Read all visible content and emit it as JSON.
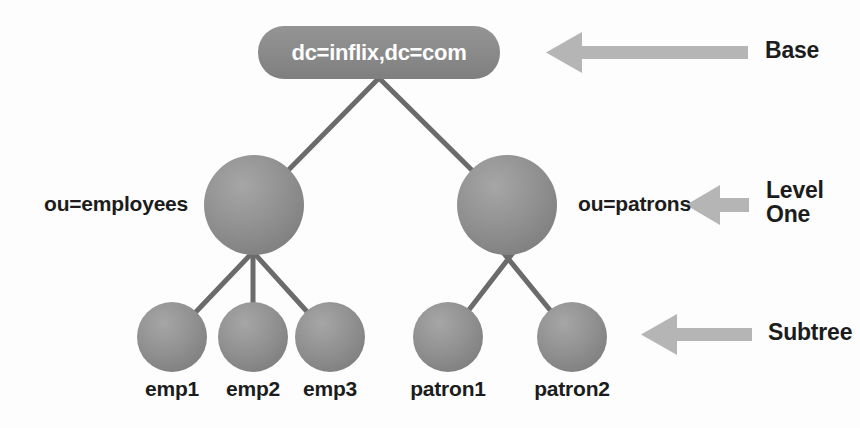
{
  "diagram": {
    "colors": {
      "node_fill": "#8d8d8d",
      "node_fill_light": "#a8a8a8",
      "node_fill_dark": "#7a7a7a",
      "edge": "#6b6b6b",
      "arrow": "#b5b5b5",
      "text": "#1c1c1c",
      "root_text": "#ffffff",
      "background": "#fdfdfd"
    },
    "root": {
      "label": "dc=inflix,dc=com",
      "shape": "rounded-rectangle"
    },
    "level_one": [
      {
        "id": "employees",
        "label": "ou=employees",
        "label_side": "left"
      },
      {
        "id": "patrons",
        "label": "ou=patrons",
        "label_side": "right"
      }
    ],
    "leaves": [
      {
        "id": "emp1",
        "label": "emp1",
        "parent": "employees"
      },
      {
        "id": "emp2",
        "label": "emp2",
        "parent": "employees"
      },
      {
        "id": "emp3",
        "label": "emp3",
        "parent": "employees"
      },
      {
        "id": "patron1",
        "label": "patron1",
        "parent": "patrons"
      },
      {
        "id": "patron2",
        "label": "patron2",
        "parent": "patrons"
      }
    ],
    "annotations": [
      {
        "id": "base",
        "label": "Base",
        "arrow": "arrow-left-icon",
        "target": "root",
        "length": "long"
      },
      {
        "id": "level-one",
        "label_line1": "Level",
        "label_line2": "One",
        "arrow": "arrow-left-icon",
        "target": "patrons",
        "length": "short"
      },
      {
        "id": "subtree",
        "label": "Subtree",
        "arrow": "arrow-left-icon",
        "target": "patron2",
        "length": "medium"
      }
    ]
  }
}
